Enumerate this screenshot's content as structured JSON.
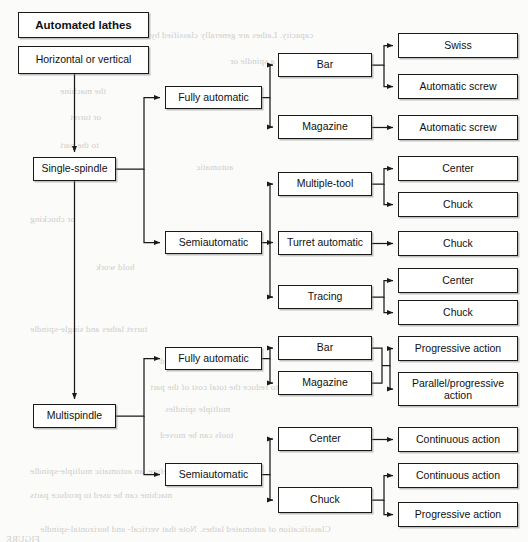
{
  "diagram": {
    "title": "Automated lathes",
    "type": "classification-tree",
    "orientation": "left-to-right",
    "background_color": "#fbfbfa",
    "box_fill": "#ffffff",
    "box_border_color": "#1a1a1a",
    "connector_color": "#1a1a1a"
  },
  "nodes": [
    {
      "id": "root",
      "label": "Automated lathes",
      "level": 0,
      "x": 18,
      "y": 12,
      "w": 131,
      "h": 26,
      "bold": true
    },
    {
      "id": "orient",
      "label": "Horizontal or vertical",
      "level": 0,
      "x": 18,
      "y": 46,
      "w": 131,
      "h": 28,
      "bold": false
    },
    {
      "id": "single",
      "label": "Single-spindle",
      "level": 1,
      "x": 33,
      "y": 157,
      "w": 83,
      "h": 24,
      "bold": false
    },
    {
      "id": "multi",
      "label": "Multispindle",
      "level": 1,
      "x": 33,
      "y": 404,
      "w": 83,
      "h": 24,
      "bold": false
    },
    {
      "id": "s_full",
      "label": "Fully automatic",
      "level": 2,
      "x": 165,
      "y": 86,
      "w": 97,
      "h": 23,
      "bold": false
    },
    {
      "id": "s_semi",
      "label": "Semiautomatic",
      "level": 2,
      "x": 165,
      "y": 231,
      "w": 97,
      "h": 23,
      "bold": false
    },
    {
      "id": "m_full",
      "label": "Fully automatic",
      "level": 2,
      "x": 165,
      "y": 347,
      "w": 97,
      "h": 23,
      "bold": false
    },
    {
      "id": "m_semi",
      "label": "Semiautomatic",
      "level": 2,
      "x": 165,
      "y": 463,
      "w": 97,
      "h": 23,
      "bold": false
    },
    {
      "id": "sf_bar",
      "label": "Bar",
      "level": 3,
      "x": 278,
      "y": 53,
      "w": 94,
      "h": 24,
      "bold": false
    },
    {
      "id": "sf_mag",
      "label": "Magazine",
      "level": 3,
      "x": 278,
      "y": 115,
      "w": 94,
      "h": 24,
      "bold": false
    },
    {
      "id": "ss_mtool",
      "label": "Multiple-tool",
      "level": 3,
      "x": 278,
      "y": 172,
      "w": 94,
      "h": 24,
      "bold": false
    },
    {
      "id": "ss_turret",
      "label": "Turret automatic",
      "level": 3,
      "x": 278,
      "y": 231,
      "w": 94,
      "h": 24,
      "bold": false
    },
    {
      "id": "ss_tracing",
      "label": "Tracing",
      "level": 3,
      "x": 278,
      "y": 285,
      "w": 94,
      "h": 24,
      "bold": false
    },
    {
      "id": "mf_bar",
      "label": "Bar",
      "level": 3,
      "x": 278,
      "y": 336,
      "w": 94,
      "h": 24,
      "bold": false
    },
    {
      "id": "mf_mag",
      "label": "Magazine",
      "level": 3,
      "x": 278,
      "y": 371,
      "w": 94,
      "h": 24,
      "bold": false
    },
    {
      "id": "ms_center",
      "label": "Center",
      "level": 3,
      "x": 278,
      "y": 427,
      "w": 94,
      "h": 24,
      "bold": false
    },
    {
      "id": "ms_chuck",
      "label": "Chuck",
      "level": 3,
      "x": 278,
      "y": 487,
      "w": 94,
      "h": 26,
      "bold": false
    },
    {
      "id": "l_swiss",
      "label": "Swiss",
      "level": 4,
      "x": 398,
      "y": 33,
      "w": 120,
      "h": 25,
      "bold": false
    },
    {
      "id": "l_ascrew1",
      "label": "Automatic screw",
      "level": 4,
      "x": 398,
      "y": 74,
      "w": 120,
      "h": 25,
      "bold": false
    },
    {
      "id": "l_ascrew2",
      "label": "Automatic screw",
      "level": 4,
      "x": 398,
      "y": 115,
      "w": 120,
      "h": 25,
      "bold": false
    },
    {
      "id": "l_center1",
      "label": "Center",
      "level": 4,
      "x": 398,
      "y": 156,
      "w": 120,
      "h": 25,
      "bold": false
    },
    {
      "id": "l_chuck1",
      "label": "Chuck",
      "level": 4,
      "x": 398,
      "y": 192,
      "w": 120,
      "h": 25,
      "bold": false
    },
    {
      "id": "l_chuck2",
      "label": "Chuck",
      "level": 4,
      "x": 398,
      "y": 231,
      "w": 120,
      "h": 25,
      "bold": false
    },
    {
      "id": "l_center2",
      "label": "Center",
      "level": 4,
      "x": 398,
      "y": 268,
      "w": 120,
      "h": 25,
      "bold": false
    },
    {
      "id": "l_chuck3",
      "label": "Chuck",
      "level": 4,
      "x": 398,
      "y": 300,
      "w": 120,
      "h": 25,
      "bold": false
    },
    {
      "id": "l_prog1",
      "label": "Progressive action",
      "level": 4,
      "x": 398,
      "y": 336,
      "w": 120,
      "h": 25,
      "bold": false
    },
    {
      "id": "l_parprog",
      "label": "Parallel/progressive action",
      "level": 4,
      "x": 398,
      "y": 372,
      "w": 120,
      "h": 34,
      "bold": false
    },
    {
      "id": "l_cont1",
      "label": "Continuous action",
      "level": 4,
      "x": 398,
      "y": 427,
      "w": 120,
      "h": 25,
      "bold": false
    },
    {
      "id": "l_cont2",
      "label": "Continuous action",
      "level": 4,
      "x": 398,
      "y": 463,
      "w": 120,
      "h": 25,
      "bold": false
    },
    {
      "id": "l_prog2",
      "label": "Progressive action",
      "level": 4,
      "x": 398,
      "y": 502,
      "w": 120,
      "h": 25,
      "bold": false
    }
  ],
  "edges": [
    {
      "from": "orient",
      "to": "single",
      "style": "vertical-down"
    },
    {
      "from": "single",
      "to": "multi",
      "style": "vertical-down"
    },
    {
      "from": "single",
      "to": "s_full",
      "style": "elbow-right"
    },
    {
      "from": "single",
      "to": "s_semi",
      "style": "elbow-right"
    },
    {
      "from": "multi",
      "to": "m_full",
      "style": "elbow-right"
    },
    {
      "from": "multi",
      "to": "m_semi",
      "style": "elbow-right"
    },
    {
      "from": "s_full",
      "to": "sf_bar",
      "style": "elbow-right"
    },
    {
      "from": "s_full",
      "to": "sf_mag",
      "style": "elbow-right"
    },
    {
      "from": "s_semi",
      "to": "ss_mtool",
      "style": "elbow-right"
    },
    {
      "from": "s_semi",
      "to": "ss_turret",
      "style": "straight"
    },
    {
      "from": "s_semi",
      "to": "ss_tracing",
      "style": "elbow-right"
    },
    {
      "from": "m_full",
      "to": "mf_bar",
      "style": "elbow-right"
    },
    {
      "from": "m_full",
      "to": "mf_mag",
      "style": "elbow-right"
    },
    {
      "from": "m_semi",
      "to": "ms_center",
      "style": "elbow-right"
    },
    {
      "from": "m_semi",
      "to": "ms_chuck",
      "style": "elbow-right"
    },
    {
      "from": "sf_bar",
      "to": "l_swiss",
      "style": "elbow-right"
    },
    {
      "from": "sf_bar",
      "to": "l_ascrew1",
      "style": "elbow-right"
    },
    {
      "from": "sf_mag",
      "to": "l_ascrew2",
      "style": "straight"
    },
    {
      "from": "ss_mtool",
      "to": "l_center1",
      "style": "elbow-right"
    },
    {
      "from": "ss_mtool",
      "to": "l_chuck1",
      "style": "elbow-right"
    },
    {
      "from": "ss_turret",
      "to": "l_chuck2",
      "style": "straight"
    },
    {
      "from": "ss_tracing",
      "to": "l_center2",
      "style": "elbow-right"
    },
    {
      "from": "ss_tracing",
      "to": "l_chuck3",
      "style": "elbow-right"
    },
    {
      "from": "mf_bar",
      "to": "l_prog1",
      "style": "merged-bus"
    },
    {
      "from": "mf_mag",
      "to": "l_parprog",
      "style": "merged-bus"
    },
    {
      "from": "ms_center",
      "to": "l_cont1",
      "style": "straight"
    },
    {
      "from": "ms_chuck",
      "to": "l_cont2",
      "style": "elbow-right"
    },
    {
      "from": "ms_chuck",
      "to": "l_prog2",
      "style": "elbow-right"
    }
  ],
  "bleed_through_text": [
    {
      "text": "capacity. Lathes are generally classified by",
      "x": 150,
      "y": 30
    },
    {
      "text": "a spindle or",
      "x": 230,
      "y": 56
    },
    {
      "text": "the machine",
      "x": 60,
      "y": 86
    },
    {
      "text": "or turret",
      "x": 70,
      "y": 112
    },
    {
      "text": "to the part",
      "x": 60,
      "y": 140
    },
    {
      "text": "automatic",
      "x": 196,
      "y": 162
    },
    {
      "text": "or chucking",
      "x": 30,
      "y": 214
    },
    {
      "text": "hold work",
      "x": 96,
      "y": 262
    },
    {
      "text": "turret lathes and single-spindle",
      "x": 30,
      "y": 324
    },
    {
      "text": "of each part are produced",
      "x": 160,
      "y": 356
    },
    {
      "text": "to reduce the total cost of the part",
      "x": 150,
      "y": 382
    },
    {
      "text": "multiple spindles",
      "x": 165,
      "y": 404
    },
    {
      "text": "tools can be moved",
      "x": 160,
      "y": 430
    },
    {
      "text": "Therefore, an automatic multiple-spindle",
      "x": 30,
      "y": 466
    },
    {
      "text": "machine can be used to produce parts",
      "x": 30,
      "y": 490
    },
    {
      "text": "Classification of automated lathes. Note that vertical- and horizontal-spindle",
      "x": 40,
      "y": 524
    },
    {
      "text": "FIGURE",
      "x": 6,
      "y": 534
    }
  ]
}
